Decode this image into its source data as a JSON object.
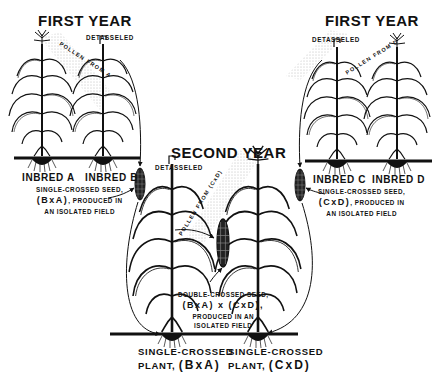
{
  "diagram": {
    "topic": "Double-cross hybrid corn production",
    "panels": {
      "first_year_left": {
        "title": "FIRST YEAR",
        "detasseled_label": "DETASSELED",
        "pollen_label": "POLLEN FROM A",
        "plants": [
          "INBRED A",
          "INBRED B"
        ],
        "seed_note": {
          "line1": "SINGLE-CROSSED SEED,",
          "cross": "(BxA)",
          "line2": ", PRODUCED IN",
          "line3": "AN ISOLATED FIELD"
        }
      },
      "first_year_right": {
        "title": "FIRST YEAR",
        "detasseled_label": "DETASSELED",
        "pollen_label": "POLLEN FROM D",
        "plants": [
          "INBRED C",
          "INBRED D"
        ],
        "seed_note": {
          "line1": "SINGLE-CROSSED SEED,",
          "cross": "(CxD)",
          "line2": ", PRODUCED IN",
          "line3": "AN ISOLATED FIELD"
        }
      },
      "second_year": {
        "title": "SECOND YEAR",
        "detasseled_label": "DETASSELED",
        "pollen_label": "POLLEN FROM (CxD)",
        "seed_note": {
          "line1": "DOUBLE-CROSSED SEED,",
          "cross": "(BxA) x (CxD),",
          "line2": "PRODUCED IN AN",
          "line3": "ISOLATED FIELD"
        },
        "plants": [
          {
            "line1": "SINGLE-CROSSED",
            "line2": "PLANT,",
            "cross": "(BxA)"
          },
          {
            "line1": "SINGLE-CROSSED",
            "line2": "PLANT,",
            "cross": "(CxD)"
          }
        ]
      }
    },
    "colors": {
      "ink": "#111111",
      "paper": "#ffffff",
      "stipple": "#888888"
    }
  }
}
